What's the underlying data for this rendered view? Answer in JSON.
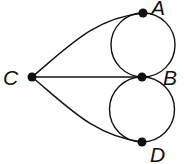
{
  "diagram": {
    "type": "graph",
    "colors": {
      "stroke": "#111111",
      "node": "#111111",
      "background": "#ffffff"
    },
    "nodes": [
      {
        "id": "A",
        "label": "A",
        "x": 143,
        "y": 13
      },
      {
        "id": "B",
        "label": "B",
        "x": 142,
        "y": 77
      },
      {
        "id": "C",
        "label": "C",
        "x": 32,
        "y": 77
      },
      {
        "id": "D",
        "label": "D",
        "x": 142,
        "y": 142
      }
    ],
    "edges": [
      {
        "from": "C",
        "to": "A",
        "shape": "curve"
      },
      {
        "from": "C",
        "to": "B",
        "shape": "line"
      },
      {
        "from": "C",
        "to": "D",
        "shape": "curve"
      },
      {
        "from": "A",
        "to": "B",
        "shape": "arc-left"
      },
      {
        "from": "A",
        "to": "B",
        "shape": "arc-right"
      },
      {
        "from": "B",
        "to": "D",
        "shape": "arc-left"
      },
      {
        "from": "B",
        "to": "D",
        "shape": "arc-right"
      }
    ]
  }
}
